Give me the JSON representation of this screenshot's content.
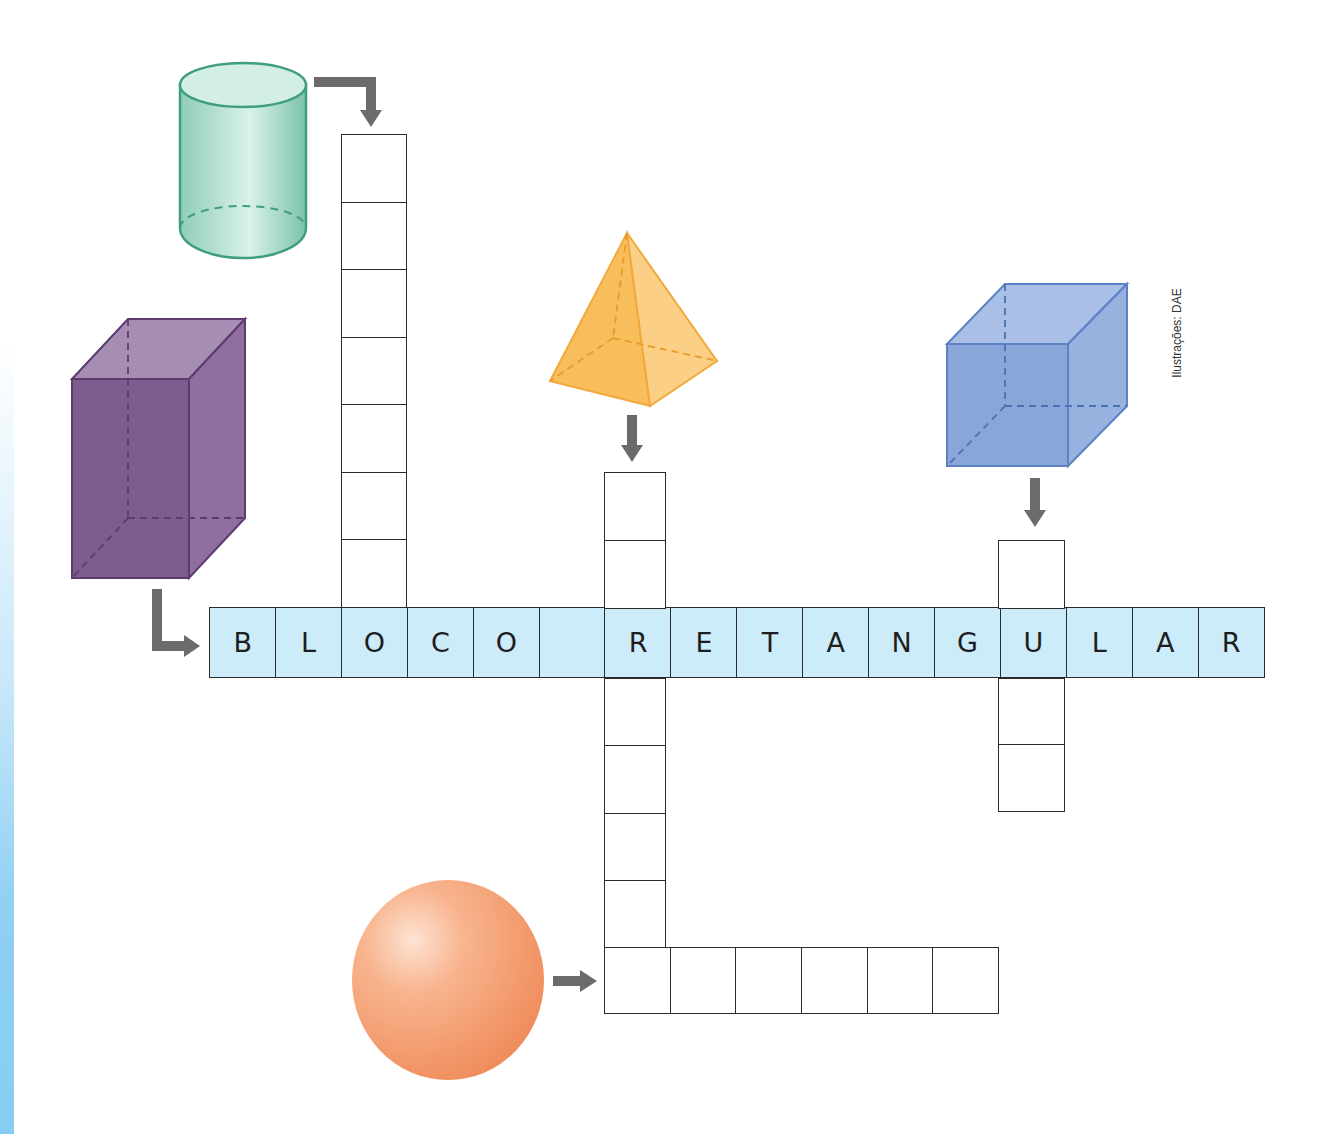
{
  "credit": "Ilustrações: DAE",
  "colors": {
    "highlight_row": "#cdecf9",
    "cell_border": "#2b2b2b",
    "arrow": "#6b6b6b",
    "cylinder": "#3f9e7f",
    "prism": "#6e4a7e",
    "pyramid": "#f2a93b",
    "cube": "#5b82c4",
    "sphere": "#f59a6d"
  },
  "solids": [
    {
      "name": "cylinder",
      "answer_length": 8,
      "direction": "down",
      "answer": ""
    },
    {
      "name": "rectangular-prism",
      "answer_length": 16,
      "direction": "across",
      "answer": "BLOCO RETANGULAR"
    },
    {
      "name": "pyramid",
      "answer_length": 8,
      "direction": "down",
      "answer": ""
    },
    {
      "name": "cube",
      "answer_length": 4,
      "direction": "down",
      "answer": ""
    },
    {
      "name": "sphere",
      "answer_length": 6,
      "direction": "across",
      "answer": ""
    }
  ],
  "main_row": {
    "letters": [
      "B",
      "L",
      "O",
      "C",
      "O",
      "",
      "R",
      "E",
      "T",
      "A",
      "N",
      "G",
      "U",
      "L",
      "A",
      "R"
    ]
  }
}
